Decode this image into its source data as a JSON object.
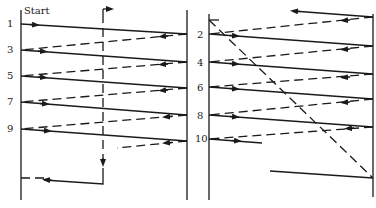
{
  "diagram": {
    "start_label": "Start",
    "left_panel": {
      "row_labels": [
        {
          "text": "1",
          "y": 24
        },
        {
          "text": "3",
          "y": 50
        },
        {
          "text": "5",
          "y": 76
        },
        {
          "text": "7",
          "y": 102
        },
        {
          "text": "9",
          "y": 129
        }
      ]
    },
    "right_panel": {
      "row_labels": [
        {
          "text": "2",
          "y": 34
        },
        {
          "text": "4",
          "y": 62
        },
        {
          "text": "6",
          "y": 87
        },
        {
          "text": "8",
          "y": 115
        },
        {
          "text": "10",
          "y": 139
        }
      ]
    },
    "colors": {
      "ink": "#1a1a1a",
      "background": "#ffffff"
    }
  }
}
